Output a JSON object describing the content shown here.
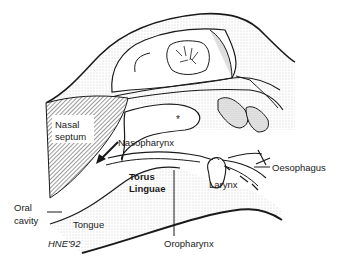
{
  "diagram": {
    "type": "anatomical sagittal section",
    "labels": {
      "nasal_septum_line1": "Nasal",
      "nasal_septum_line2": "septum",
      "nasopharynx": "Nasopharynx",
      "asterisk": "*",
      "torus_line1": "Torus",
      "torus_line2": "Linguae",
      "oral_cavity_line1": "Oral",
      "oral_cavity_line2": "cavity",
      "tongue": "Tongue",
      "signature": "HNE'92",
      "larynx": "Larynx",
      "oesophagus": "Oesophagus",
      "oropharynx": "Oropharynx"
    },
    "colors": {
      "line": "#1a1a1a",
      "stipple": "#bdbdbd",
      "hatch": "#333333",
      "background": "#ffffff"
    }
  }
}
